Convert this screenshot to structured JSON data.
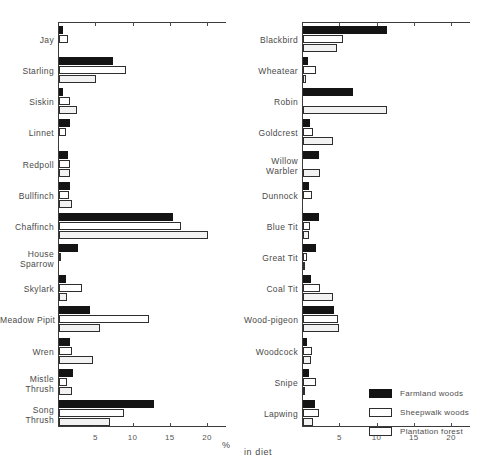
{
  "chart_data": {
    "type": "bar",
    "title": "",
    "xlabel": "% in diet",
    "ylabel": "",
    "xlim": [
      0,
      22
    ],
    "grid": false,
    "orientation": "horizontal",
    "legend_position": "bottom-right",
    "xticks": [
      5,
      10,
      15,
      20
    ],
    "series_names": [
      "Farmland woods",
      "Sheepwalk woods",
      "Plantation forest"
    ],
    "panels": [
      {
        "name": "left-panel",
        "categories": [
          "Jay",
          "Starling",
          "Siskin",
          "Linnet",
          "Redpoll",
          "Bullfinch",
          "Chaffinch",
          "House Sparrow",
          "Skylark",
          "Meadow Pipit",
          "Wren",
          "Mistle Thrush",
          "Song Thrush"
        ],
        "series": [
          {
            "name": "Farmland woods",
            "values": [
              0.5,
              7.2,
              0.5,
              1.5,
              1.2,
              1.5,
              15.3,
              2.6,
              1.0,
              4.1,
              1.5,
              1.9,
              12.8
            ]
          },
          {
            "name": "Sheepwalk woods",
            "values": [
              1.2,
              9.0,
              1.5,
              1.0,
              1.5,
              1.3,
              16.3,
              0.2,
              3.1,
              12.1,
              1.8,
              1.1,
              8.7
            ]
          },
          {
            "name": "Plantation forest",
            "values": [
              0.0,
              5.0,
              2.4,
              0.0,
              1.5,
              1.7,
              20.0,
              0.0,
              1.1,
              5.5,
              4.5,
              1.7,
              6.8
            ]
          }
        ]
      },
      {
        "name": "right-panel",
        "categories": [
          "Blackbird",
          "Wheatear",
          "Robin",
          "Goldcrest",
          "Willow Warbler",
          "Dunnock",
          "Blue Tit",
          "Great Tit",
          "Coal Tit",
          "Wood-pigeon",
          "Woodcock",
          "Snipe",
          "Lapwing"
        ],
        "series": [
          {
            "name": "Farmland woods",
            "values": [
              11.3,
              0.7,
              6.7,
              0.9,
              2.1,
              0.8,
              2.2,
              1.7,
              1.1,
              4.1,
              0.5,
              0.8,
              1.6
            ]
          },
          {
            "name": "Sheepwalk woods",
            "values": [
              5.3,
              1.8,
              0.0,
              1.3,
              0.0,
              1.2,
              0.9,
              0.6,
              2.3,
              4.7,
              1.2,
              1.8,
              2.2
            ]
          },
          {
            "name": "Plantation forest",
            "values": [
              4.6,
              0.4,
              11.3,
              4.0,
              2.3,
              0.0,
              0.8,
              0.3,
              4.0,
              4.8,
              1.1,
              0.3,
              1.3
            ]
          }
        ]
      }
    ]
  },
  "axis": {
    "percent_symbol": "%",
    "in_diet": "in  diet"
  }
}
